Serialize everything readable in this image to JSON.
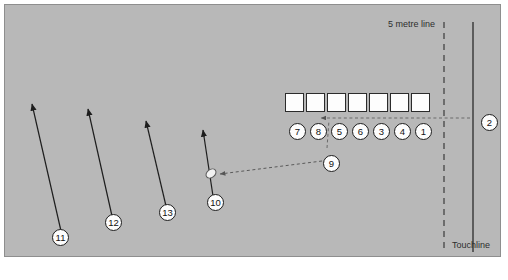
{
  "diagram": {
    "field_color": "#b8b8b8",
    "border_color": "#8e8e8e",
    "line_color": "#2b2b2b"
  },
  "labels": {
    "five_metre_line": "5 metre line",
    "touchline": "Touchline"
  },
  "lineout_squares": [
    {
      "name": "opposition-marker-1"
    },
    {
      "name": "opposition-marker-2"
    },
    {
      "name": "opposition-marker-3"
    },
    {
      "name": "opposition-marker-4"
    },
    {
      "name": "opposition-marker-5"
    },
    {
      "name": "opposition-marker-6"
    },
    {
      "name": "opposition-marker-7"
    }
  ],
  "lineout_players": [
    {
      "number": "7",
      "x": 289,
      "y": 123
    },
    {
      "number": "8",
      "x": 310,
      "y": 123
    },
    {
      "number": "5",
      "x": 331,
      "y": 123
    },
    {
      "number": "6",
      "x": 352,
      "y": 123
    },
    {
      "number": "3",
      "x": 373,
      "y": 123
    },
    {
      "number": "4",
      "x": 394,
      "y": 123
    },
    {
      "number": "1",
      "x": 415,
      "y": 123
    }
  ],
  "support_players": [
    {
      "number": "9",
      "x": 323,
      "y": 155
    },
    {
      "number": "2",
      "x": 481,
      "y": 114
    },
    {
      "number": "10",
      "x": 207,
      "y": 194
    },
    {
      "number": "13",
      "x": 159,
      "y": 204
    },
    {
      "number": "12",
      "x": 105,
      "y": 214
    },
    {
      "number": "11",
      "x": 52,
      "y": 229
    }
  ],
  "ball": {
    "name": "rugby-ball",
    "x": 205,
    "y": 169
  },
  "run_arrows": [
    {
      "name": "run-arrow-11",
      "x1": 61,
      "y1": 231,
      "x2": 32,
      "y2": 104
    },
    {
      "name": "run-arrow-12",
      "x1": 112,
      "y1": 216,
      "x2": 88,
      "y2": 109
    },
    {
      "name": "run-arrow-13",
      "x1": 166,
      "y1": 206,
      "x2": 146,
      "y2": 121
    },
    {
      "name": "run-arrow-10",
      "x1": 213,
      "y1": 196,
      "x2": 203,
      "y2": 130
    }
  ],
  "pass_arrows": [
    {
      "name": "pass-arrow-9-to-ball",
      "x1": 322,
      "y1": 161,
      "x2": 220,
      "y2": 174
    },
    {
      "name": "throw-line-2-to-lineout",
      "x1": 470,
      "y1": 118,
      "x2": 321,
      "y2": 118
    }
  ],
  "pitch_lines": {
    "five_metre_dashed_x": 444,
    "touchline_solid_x": 473
  }
}
